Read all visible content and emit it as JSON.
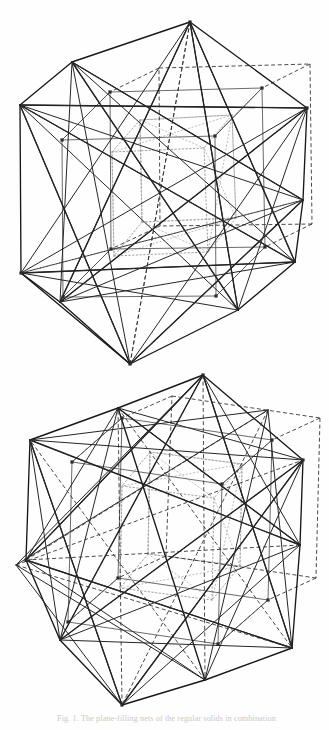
{
  "page": {
    "background_color": "#fefefe",
    "width": 329,
    "height": 730,
    "ink_color": "#1b1b1b"
  },
  "caption": {
    "text": "Fig. 1.  The plane-filling nets of the regular solids in combination",
    "color": "#c9c9c9",
    "clipped": true
  },
  "figures": [
    {
      "id": "figure-top",
      "name": "nested-polyhedra-upper",
      "label": "Upper figure: icosahedron with inscribed cube and dodecahedron",
      "hull_type": "icosahedron-silhouette",
      "line_styles": [
        "solid",
        "dashed",
        "dotted"
      ],
      "apex_top": {
        "x": 190,
        "y": 22
      },
      "apex_bottom": {
        "x": 130,
        "y": 364
      },
      "left_extreme": {
        "x": 21,
        "y": 105
      },
      "right_extreme": {
        "x": 307,
        "y": 108
      }
    },
    {
      "id": "figure-bottom",
      "name": "nested-polyhedra-lower",
      "label": "Lower figure: icosahedron with inscribed cube and dodecahedron, rotated view",
      "hull_type": "icosahedron-silhouette",
      "line_styles": [
        "solid",
        "dashed",
        "dotted"
      ],
      "apex_top": {
        "x": 203,
        "y": 375
      },
      "apex_bottom": {
        "x": 122,
        "y": 705
      },
      "left_extreme": {
        "x": 16,
        "y": 565
      },
      "right_extreme": {
        "x": 303,
        "y": 460
      }
    }
  ],
  "geometry_top": {
    "hull": [
      [
        190,
        22
      ],
      [
        307,
        108
      ],
      [
        303,
        200
      ],
      [
        295,
        262
      ],
      [
        238,
        310
      ],
      [
        130,
        364
      ],
      [
        60,
        302
      ],
      [
        21,
        273
      ],
      [
        20,
        105
      ],
      [
        72,
        62
      ]
    ],
    "outer_solid": [
      [
        [
          190,
          22
        ],
        [
          307,
          108
        ]
      ],
      [
        [
          307,
          108
        ],
        [
          303,
          200
        ]
      ],
      [
        [
          303,
          200
        ],
        [
          295,
          262
        ]
      ],
      [
        [
          295,
          262
        ],
        [
          238,
          310
        ]
      ],
      [
        [
          238,
          310
        ],
        [
          130,
          364
        ]
      ],
      [
        [
          130,
          364
        ],
        [
          60,
          302
        ]
      ],
      [
        [
          60,
          302
        ],
        [
          21,
          273
        ]
      ],
      [
        [
          21,
          273
        ],
        [
          20,
          105
        ]
      ],
      [
        [
          20,
          105
        ],
        [
          72,
          62
        ]
      ],
      [
        [
          72,
          62
        ],
        [
          190,
          22
        ]
      ],
      [
        [
          190,
          22
        ],
        [
          238,
          310
        ]
      ],
      [
        [
          190,
          22
        ],
        [
          60,
          302
        ]
      ],
      [
        [
          190,
          22
        ],
        [
          295,
          262
        ]
      ],
      [
        [
          130,
          364
        ],
        [
          303,
          200
        ]
      ],
      [
        [
          130,
          364
        ],
        [
          21,
          273
        ]
      ],
      [
        [
          130,
          364
        ],
        [
          20,
          105
        ]
      ],
      [
        [
          20,
          105
        ],
        [
          307,
          108
        ]
      ],
      [
        [
          72,
          62
        ],
        [
          303,
          200
        ]
      ],
      [
        [
          21,
          273
        ],
        [
          295,
          262
        ]
      ],
      [
        [
          60,
          302
        ],
        [
          307,
          108
        ]
      ],
      [
        [
          72,
          62
        ],
        [
          238,
          310
        ]
      ],
      [
        [
          20,
          105
        ],
        [
          295,
          262
        ]
      ]
    ],
    "cube_solid": [
      [
        [
          110,
          92
        ],
        [
          262,
          88
        ]
      ],
      [
        [
          262,
          88
        ],
        [
          265,
          247
        ]
      ],
      [
        [
          265,
          247
        ],
        [
          111,
          249
        ]
      ],
      [
        [
          111,
          249
        ],
        [
          110,
          92
        ]
      ],
      [
        [
          62,
          140
        ],
        [
          215,
          136
        ]
      ],
      [
        [
          215,
          136
        ],
        [
          216,
          296
        ]
      ],
      [
        [
          216,
          296
        ],
        [
          63,
          297
        ]
      ],
      [
        [
          63,
          297
        ],
        [
          62,
          140
        ]
      ],
      [
        [
          110,
          92
        ],
        [
          62,
          140
        ]
      ],
      [
        [
          262,
          88
        ],
        [
          215,
          136
        ]
      ],
      [
        [
          265,
          247
        ],
        [
          216,
          296
        ]
      ],
      [
        [
          111,
          249
        ],
        [
          63,
          297
        ]
      ]
    ],
    "cube_dashed": [
      [
        [
          159,
          68
        ],
        [
          310,
          64
        ]
      ],
      [
        [
          310,
          64
        ],
        [
          312,
          224
        ]
      ],
      [
        [
          312,
          224
        ],
        [
          160,
          226
        ]
      ],
      [
        [
          160,
          226
        ],
        [
          159,
          68
        ]
      ],
      [
        [
          159,
          68
        ],
        [
          110,
          92
        ]
      ],
      [
        [
          310,
          64
        ],
        [
          262,
          88
        ]
      ],
      [
        [
          312,
          224
        ],
        [
          265,
          247
        ]
      ],
      [
        [
          160,
          226
        ],
        [
          111,
          249
        ]
      ]
    ],
    "inner_dotted": [
      [
        [
          140,
          120
        ],
        [
          232,
          115
        ]
      ],
      [
        [
          232,
          115
        ],
        [
          236,
          218
        ]
      ],
      [
        [
          236,
          218
        ],
        [
          142,
          222
        ]
      ],
      [
        [
          142,
          222
        ],
        [
          140,
          120
        ]
      ],
      [
        [
          112,
          152
        ],
        [
          204,
          148
        ]
      ],
      [
        [
          204,
          148
        ],
        [
          208,
          252
        ]
      ],
      [
        [
          208,
          252
        ],
        [
          114,
          256
        ]
      ],
      [
        [
          114,
          256
        ],
        [
          112,
          152
        ]
      ],
      [
        [
          140,
          120
        ],
        [
          112,
          152
        ]
      ],
      [
        [
          232,
          115
        ],
        [
          204,
          148
        ]
      ],
      [
        [
          236,
          218
        ],
        [
          208,
          252
        ]
      ],
      [
        [
          142,
          222
        ],
        [
          114,
          256
        ]
      ]
    ],
    "vertices": [
      [
        110,
        92
      ],
      [
        262,
        88
      ],
      [
        265,
        247
      ],
      [
        111,
        249
      ],
      [
        62,
        140
      ],
      [
        215,
        136
      ],
      [
        216,
        296
      ],
      [
        63,
        297
      ],
      [
        190,
        22
      ],
      [
        130,
        364
      ],
      [
        21,
        273
      ],
      [
        307,
        108
      ]
    ]
  },
  "geometry_bottom": {
    "hull": [
      [
        203,
        375
      ],
      [
        268,
        410
      ],
      [
        303,
        460
      ],
      [
        300,
        545
      ],
      [
        292,
        648
      ],
      [
        205,
        680
      ],
      [
        122,
        705
      ],
      [
        60,
        640
      ],
      [
        26,
        560
      ],
      [
        16,
        565
      ],
      [
        30,
        440
      ],
      [
        118,
        408
      ]
    ],
    "outer_solid": [
      [
        [
          203,
          375
        ],
        [
          303,
          460
        ]
      ],
      [
        [
          303,
          460
        ],
        [
          300,
          545
        ]
      ],
      [
        [
          300,
          545
        ],
        [
          292,
          648
        ]
      ],
      [
        [
          292,
          648
        ],
        [
          205,
          680
        ]
      ],
      [
        [
          205,
          680
        ],
        [
          122,
          705
        ]
      ],
      [
        [
          122,
          705
        ],
        [
          60,
          640
        ]
      ],
      [
        [
          60,
          640
        ],
        [
          26,
          560
        ]
      ],
      [
        [
          26,
          560
        ],
        [
          30,
          440
        ]
      ],
      [
        [
          30,
          440
        ],
        [
          118,
          408
        ]
      ],
      [
        [
          118,
          408
        ],
        [
          203,
          375
        ]
      ],
      [
        [
          203,
          375
        ],
        [
          292,
          648
        ]
      ],
      [
        [
          203,
          375
        ],
        [
          26,
          560
        ]
      ],
      [
        [
          122,
          705
        ],
        [
          303,
          460
        ]
      ],
      [
        [
          122,
          705
        ],
        [
          30,
          440
        ]
      ],
      [
        [
          30,
          440
        ],
        [
          300,
          545
        ]
      ],
      [
        [
          118,
          408
        ],
        [
          300,
          545
        ]
      ],
      [
        [
          26,
          560
        ],
        [
          292,
          648
        ]
      ],
      [
        [
          60,
          640
        ],
        [
          303,
          460
        ]
      ],
      [
        [
          118,
          408
        ],
        [
          205,
          680
        ]
      ],
      [
        [
          203,
          375
        ],
        [
          60,
          640
        ]
      ]
    ],
    "cube_solid": [
      [
        [
          122,
          418
        ],
        [
          272,
          440
        ]
      ],
      [
        [
          272,
          440
        ],
        [
          268,
          600
        ]
      ],
      [
        [
          268,
          600
        ],
        [
          118,
          578
        ]
      ],
      [
        [
          118,
          578
        ],
        [
          122,
          418
        ]
      ],
      [
        [
          72,
          462
        ],
        [
          222,
          484
        ]
      ],
      [
        [
          222,
          484
        ],
        [
          218,
          644
        ]
      ],
      [
        [
          218,
          644
        ],
        [
          68,
          622
        ]
      ],
      [
        [
          68,
          622
        ],
        [
          72,
          462
        ]
      ],
      [
        [
          122,
          418
        ],
        [
          72,
          462
        ]
      ],
      [
        [
          272,
          440
        ],
        [
          222,
          484
        ]
      ],
      [
        [
          268,
          600
        ],
        [
          218,
          644
        ]
      ],
      [
        [
          118,
          578
        ],
        [
          68,
          622
        ]
      ]
    ],
    "cube_dashed": [
      [
        [
          172,
          396
        ],
        [
          320,
          418
        ]
      ],
      [
        [
          320,
          418
        ],
        [
          316,
          578
        ]
      ],
      [
        [
          316,
          578
        ],
        [
          166,
          556
        ]
      ],
      [
        [
          166,
          556
        ],
        [
          172,
          396
        ]
      ],
      [
        [
          172,
          396
        ],
        [
          122,
          418
        ]
      ],
      [
        [
          320,
          418
        ],
        [
          272,
          440
        ]
      ],
      [
        [
          316,
          578
        ],
        [
          268,
          600
        ]
      ],
      [
        [
          166,
          556
        ],
        [
          118,
          578
        ]
      ]
    ],
    "inner_dotted": [
      [
        [
          150,
          452
        ],
        [
          242,
          464
        ]
      ],
      [
        [
          242,
          464
        ],
        [
          240,
          566
        ]
      ],
      [
        [
          240,
          566
        ],
        [
          148,
          554
        ]
      ],
      [
        [
          148,
          554
        ],
        [
          150,
          452
        ]
      ],
      [
        [
          122,
          486
        ],
        [
          214,
          498
        ]
      ],
      [
        [
          214,
          498
        ],
        [
          212,
          600
        ]
      ],
      [
        [
          212,
          600
        ],
        [
          120,
          588
        ]
      ],
      [
        [
          120,
          588
        ],
        [
          122,
          486
        ]
      ],
      [
        [
          150,
          452
        ],
        [
          122,
          486
        ]
      ],
      [
        [
          242,
          464
        ],
        [
          214,
          498
        ]
      ],
      [
        [
          240,
          566
        ],
        [
          212,
          600
        ]
      ],
      [
        [
          148,
          554
        ],
        [
          120,
          588
        ]
      ]
    ],
    "vertices": [
      [
        122,
        418
      ],
      [
        272,
        440
      ],
      [
        268,
        600
      ],
      [
        118,
        578
      ],
      [
        72,
        462
      ],
      [
        222,
        484
      ],
      [
        218,
        644
      ],
      [
        68,
        622
      ],
      [
        203,
        375
      ],
      [
        122,
        705
      ],
      [
        26,
        560
      ],
      [
        303,
        460
      ]
    ]
  }
}
